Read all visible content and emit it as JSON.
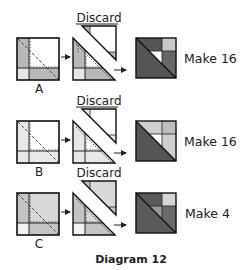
{
  "title": "Diagram 12",
  "rows": [
    {
      "id": "A",
      "label": "A",
      "discard_label": "Discard",
      "result_label": "Make 16",
      "count": 16,
      "colors": {
        "left_strip": "#b8b8b8",
        "main": "#ffffff",
        "bottom_strip": "#b8b8b8",
        "corner": "#e6e6e6",
        "result_dark": "#555555",
        "result_mid": "#666666",
        "result_light": "#c8c8c8",
        "result_white": "#ffffff"
      }
    },
    {
      "id": "B",
      "label": "B",
      "discard_label": "Discard",
      "result_label": "Make 16",
      "count": 16,
      "colors": {
        "left_strip": "#e8e8e8",
        "main": "#ffffff",
        "bottom_strip": "#e8e8e8",
        "corner": "#e8e8e8",
        "result_dark": "#555555",
        "result_mid": "#cfcfcf",
        "result_light": "#bdbdbd",
        "result_white": "#ffffff"
      }
    },
    {
      "id": "C",
      "label": "C",
      "discard_label": "Discard",
      "result_label": "Make 4",
      "count": 4,
      "colors": {
        "left_strip": "#c4c4c4",
        "main": "#d8d8d8",
        "bottom_strip": "#c4c4c4",
        "corner": "#f2f2f2",
        "result_dark": "#5a5a5a",
        "result_mid": "#6a6a6a",
        "result_light": "#d4d4d4",
        "result_white": "#9a9a9a"
      }
    }
  ]
}
